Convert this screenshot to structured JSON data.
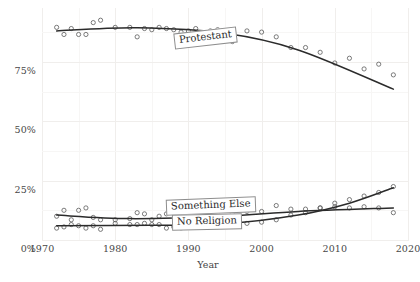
{
  "chart_data": {
    "type": "scatter",
    "title": "",
    "subtitle": "",
    "xlabel": "Year",
    "ylabel": "",
    "xlim": [
      1970,
      2020
    ],
    "ylim": [
      0,
      0.95
    ],
    "grid": true,
    "legend": "direct-labels-on-plot",
    "xticks": [
      1970,
      1980,
      1990,
      2000,
      2010,
      2020
    ],
    "xticklabels": [
      "1970",
      "1980",
      "1990",
      "2000",
      "2010",
      "2020"
    ],
    "yticks": [
      0,
      25,
      50,
      75
    ],
    "yticklabels": [
      "0%",
      "25%",
      "50%",
      "75%"
    ],
    "marker": "open-circle",
    "series": [
      {
        "name": "Protestant",
        "label": "Protestant",
        "color": "#2b2b2b",
        "x": [
          1972,
          1973,
          1974,
          1975,
          1976,
          1977,
          1978,
          1980,
          1982,
          1983,
          1984,
          1985,
          1986,
          1987,
          1988,
          1989,
          1990,
          1991,
          1993,
          1994,
          1996,
          1998,
          2000,
          2002,
          2004,
          2006,
          2008,
          2010,
          2012,
          2014,
          2016,
          2018
        ],
        "y": [
          89.5,
          86.5,
          89.0,
          86.5,
          86.5,
          91.5,
          92.5,
          89.5,
          89.5,
          85.5,
          89.0,
          88.5,
          89.5,
          89.0,
          88.5,
          87.5,
          88.0,
          89.0,
          88.0,
          88.5,
          83.5,
          88.0,
          87.5,
          85.5,
          81.0,
          81.0,
          79.0,
          74.5,
          76.5,
          72.0,
          74.0,
          69.5
        ],
        "trend_endpoints": [
          [
            1972,
            88.0
          ],
          [
            1983,
            89.3
          ],
          [
            1995,
            87.0
          ],
          [
            2005,
            80.0
          ],
          [
            2018,
            63.5
          ]
        ]
      },
      {
        "name": "Something Else",
        "label": "Something Else",
        "color": "#2b2b2b",
        "x": [
          1972,
          1973,
          1974,
          1975,
          1976,
          1977,
          1978,
          1980,
          1982,
          1983,
          1984,
          1985,
          1986,
          1987,
          1988,
          1989,
          1990,
          1991,
          1993,
          1994,
          1996,
          1998,
          2000,
          2002,
          2004,
          2006,
          2008,
          2010,
          2012,
          2014,
          2016,
          2018
        ],
        "y": [
          10.0,
          12.5,
          8.5,
          12.5,
          13.5,
          9.5,
          8.5,
          8.5,
          9.0,
          11.5,
          11.0,
          8.5,
          10.0,
          11.0,
          12.5,
          13.0,
          11.5,
          12.0,
          11.0,
          11.5,
          11.0,
          12.0,
          12.0,
          14.5,
          13.0,
          13.0,
          13.5,
          14.0,
          13.5,
          14.0,
          13.5,
          11.5
        ],
        "trend_endpoints": [
          [
            1972,
            10.5
          ],
          [
            1982,
            9.0
          ],
          [
            1995,
            10.0
          ],
          [
            2005,
            12.0
          ],
          [
            2018,
            13.5
          ]
        ]
      },
      {
        "name": "No Religion",
        "label": "No Religion",
        "color": "#2b2b2b",
        "x": [
          1972,
          1973,
          1974,
          1975,
          1976,
          1977,
          1978,
          1980,
          1982,
          1983,
          1984,
          1985,
          1986,
          1987,
          1988,
          1989,
          1990,
          1991,
          1993,
          1994,
          1996,
          1998,
          2000,
          2002,
          2004,
          2006,
          2008,
          2010,
          2012,
          2014,
          2016,
          2018
        ],
        "y": [
          5.0,
          5.5,
          6.5,
          6.0,
          5.0,
          6.0,
          4.5,
          7.0,
          6.5,
          6.5,
          7.0,
          6.5,
          6.5,
          5.0,
          5.5,
          5.0,
          6.5,
          6.0,
          5.5,
          5.5,
          6.0,
          7.0,
          7.5,
          8.5,
          10.5,
          11.5,
          13.5,
          15.5,
          17.0,
          18.5,
          20.0,
          22.5
        ],
        "trend_endpoints": [
          [
            1972,
            6.0
          ],
          [
            1985,
            6.2
          ],
          [
            1995,
            6.8
          ],
          [
            2005,
            10.5
          ],
          [
            2012,
            15.5
          ],
          [
            2018,
            22.0
          ]
        ]
      }
    ],
    "crossover_note": "No Religion surpasses Something Else around 2011-2012"
  },
  "axis": {
    "x_title": "Year",
    "x_tick_labels": [
      "1970",
      "1980",
      "1990",
      "2000",
      "2010",
      "2020"
    ],
    "y_tick_labels": [
      "0%",
      "25%",
      "50%",
      "75%"
    ]
  },
  "labels": {
    "protestant": "Protestant",
    "something_else": "Something Else",
    "no_religion": "No Religion"
  },
  "colors": {
    "line": "#2b2b2b",
    "marker_stroke": "#5a5a5a",
    "grid": "#f0eeec",
    "text": "#474747",
    "label_box_border": "#8d8d8d",
    "background": "#ffffff"
  }
}
